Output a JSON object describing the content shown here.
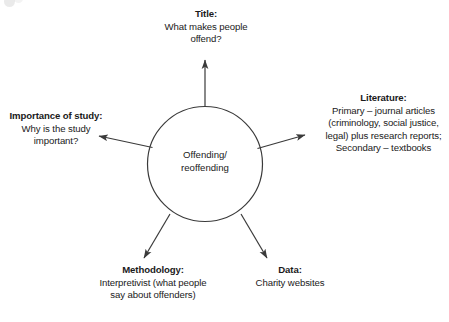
{
  "diagram": {
    "type": "mind-map",
    "hub": {
      "label": "Offending/\nreoffending"
    },
    "nodes": [
      {
        "id": "title",
        "heading": "Title:",
        "body": "What makes people\noffend?",
        "direction": "up"
      },
      {
        "id": "literature",
        "heading": "Literature:",
        "body": "Primary – journal articles\n(criminology, social justice,\nlegal) plus research reports;\nSecondary – textbooks",
        "direction": "right"
      },
      {
        "id": "importance",
        "heading": "Importance\nof study:",
        "body": "Why is the study\nimportant?",
        "direction": "left"
      },
      {
        "id": "methodology",
        "heading": "Methodology:",
        "body": "Interpretivist (what people\nsay about offenders)",
        "direction": "down-left"
      },
      {
        "id": "data",
        "heading": "Data:",
        "body": "Charity websites",
        "direction": "down-right"
      }
    ],
    "colors": {
      "stroke": "#3a3a3a",
      "text": "#1a1a1a",
      "background": "#ffffff"
    }
  }
}
